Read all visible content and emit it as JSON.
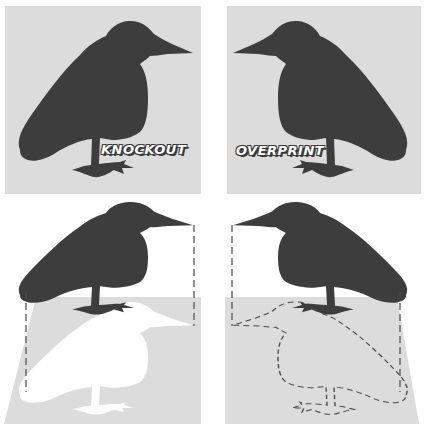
{
  "figure": {
    "panels": [
      {
        "id": "knockout-panel",
        "label": "KNOCKOUT",
        "bird_facing": "right"
      },
      {
        "id": "overprint-panel",
        "label": "OVERPRINT",
        "bird_facing": "left"
      },
      {
        "id": "knockout-diagram",
        "bird_facing": "right",
        "shadow_style": "white-knockout"
      },
      {
        "id": "overprint-diagram",
        "bird_facing": "left",
        "shadow_style": "dashed-outline"
      }
    ],
    "colors": {
      "background": "#ffffff",
      "panel_gray": "#dcdcdc",
      "bird": "#3d3d3d",
      "knockout_shadow": "#ffffff",
      "dash": "#4a4a4a"
    }
  }
}
